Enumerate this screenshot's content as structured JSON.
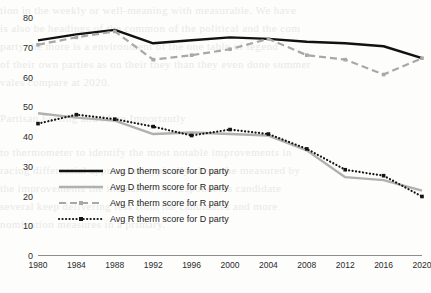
{
  "background": {
    "description": "faint scanned-page bleed-through text behind the chart",
    "lines": [
      "tion in the weekly or well-meaning with measurable. We have",
      "is also be headings of the common of the political and the com",
      "party the more is a environment of the one table of legend",
      "of their own parties as on their they than they even done summer",
      "vales compare at 2020."
    ],
    "lines_lower": [
      "Partisan Feeling and More Importantly",
      "to thermometer to identify the most notable improvements in",
      "racing differential approached typically about the measured by",
      "the improvements the indication the respondents candidate",
      "several keep delivering less from the candidates and more",
      "nomination measures in a primary."
    ]
  },
  "chart_data": {
    "type": "line",
    "title": "",
    "subtitle": "",
    "xlabel": "",
    "ylabel": "",
    "x": [
      1980,
      1984,
      1988,
      1992,
      1996,
      2000,
      2004,
      2008,
      2012,
      2016,
      2020
    ],
    "categories": [
      "1980",
      "1984",
      "1988",
      "1992",
      "1996",
      "2000",
      "2004",
      "2008",
      "2012",
      "2016",
      "2020"
    ],
    "xlim": [
      1980,
      2020
    ],
    "ylim": [
      0,
      80
    ],
    "ytick_step": 10,
    "yticks": [
      0,
      10,
      20,
      30,
      40,
      50,
      60,
      70,
      80
    ],
    "ytick_labels": [
      "0",
      "10",
      "20",
      "30",
      "40",
      "50",
      "60",
      "70",
      "80"
    ],
    "grid": false,
    "legend_position": "inside-lower-left",
    "series": [
      {
        "name": "Avg D therm score for D party",
        "color": "#111111",
        "style": "solid",
        "width": 2.4,
        "marker": "none",
        "values": [
          72.5,
          74.5,
          76.0,
          71.5,
          72.5,
          73.5,
          73.0,
          72.0,
          71.5,
          70.5,
          66.5
        ]
      },
      {
        "name": "Avg D therm score for R party",
        "color": "#b0b0b0",
        "style": "solid",
        "width": 2.4,
        "marker": "none",
        "values": [
          48.0,
          46.5,
          45.5,
          41.0,
          41.5,
          41.0,
          40.5,
          35.5,
          26.5,
          25.5,
          22.0
        ]
      },
      {
        "name": "Avg R therm score for R party",
        "color": "#a8a8a8",
        "style": "dashed",
        "width": 2.2,
        "marker": "square",
        "values": [
          71.0,
          73.5,
          75.5,
          66.0,
          67.5,
          69.5,
          73.0,
          67.5,
          66.0,
          61.0,
          66.5
        ]
      },
      {
        "name": "Avg R therm score for D party",
        "color": "#141414",
        "style": "dotted",
        "width": 2.2,
        "marker": "square",
        "values": [
          44.5,
          47.5,
          46.0,
          43.5,
          40.5,
          42.5,
          41.0,
          36.0,
          29.0,
          27.0,
          20.0
        ]
      }
    ]
  },
  "legend": {
    "entries": [
      {
        "label": "Avg D therm score for D party"
      },
      {
        "label": "Avg D therm score for R party"
      },
      {
        "label": "Avg R therm score for R party"
      },
      {
        "label": "Avg R therm score for D party"
      }
    ]
  }
}
